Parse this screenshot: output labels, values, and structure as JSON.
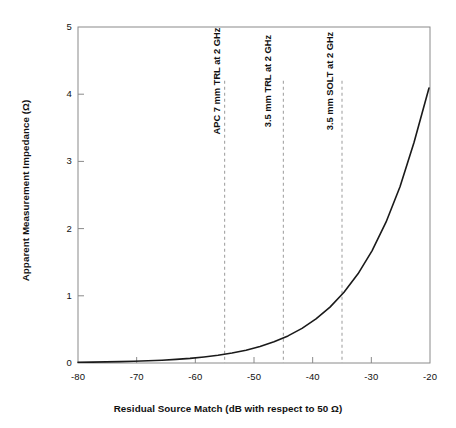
{
  "chart_data": {
    "type": "line",
    "title": "",
    "xlabel": "Residual Source Match (dB with respect to 50 Ω)",
    "ylabel": "Apparent Measurement Impedance (Ω)",
    "xlim": [
      -80,
      -20
    ],
    "ylim": [
      0,
      5
    ],
    "xticks": [
      -80,
      -70,
      -60,
      -50,
      -40,
      -30,
      -20
    ],
    "xtick_labels": [
      "-80",
      "-70",
      "-60",
      "-50",
      "-40",
      "-30",
      "-20"
    ],
    "yticks": [
      0,
      1,
      2,
      3,
      4,
      5
    ],
    "ytick_labels": [
      "0",
      "1",
      "2",
      "3",
      "4",
      "5"
    ],
    "grid": false,
    "legend": false,
    "series": [
      {
        "name": "Apparent Measurement Impedance",
        "color": "#1a1a1a",
        "x": [
          -80,
          -78,
          -76,
          -74,
          -72,
          -70,
          -68,
          -66,
          -64,
          -62,
          -60,
          -58,
          -56,
          -55,
          -54,
          -52,
          -50,
          -48,
          -46,
          -45,
          -44,
          -42,
          -40,
          -38,
          -36,
          -35,
          -34,
          -32,
          -30,
          -29,
          -28,
          -27,
          -26,
          -25,
          -24,
          -23,
          -22,
          -21,
          -20
        ],
        "y": [
          1.02,
          1.025,
          1.032,
          1.04,
          1.05,
          1.063,
          1.079,
          1.1,
          1.126,
          1.159,
          1.2,
          1.252,
          1.316,
          1.355,
          1.398,
          1.501,
          1.632,
          1.796,
          2.002,
          2.125,
          2.261,
          2.585,
          3.0,
          3.521,
          4.175,
          4.56,
          4.99,
          5.96,
          7.16,
          7.83,
          8.6,
          9.5,
          10.5,
          11.6,
          12.8,
          14.2,
          15.7,
          17.4,
          19.4
        ],
        "y_plot": [
          1.02,
          1.022,
          1.025,
          1.029,
          1.033,
          1.038,
          1.044,
          1.051,
          1.06,
          1.071,
          1.085,
          1.102,
          1.123,
          1.135,
          1.15,
          1.18,
          1.22,
          1.27,
          1.33,
          1.37,
          1.41,
          1.5,
          1.62,
          1.76,
          1.94,
          2.04,
          2.15,
          2.41,
          2.72,
          2.9,
          3.1,
          3.3,
          3.53,
          3.79,
          4.08,
          4.4,
          4.76,
          5.16,
          5.6
        ]
      }
    ],
    "annotations": [
      {
        "label": "APC 7 mm TRL at 2 GHz",
        "x": -55,
        "line_style": "dashed",
        "line_color": "#9a9a9a",
        "y_top": 4.2,
        "y_bottom": 0
      },
      {
        "label": "3.5 mm TRL at 2 GHz",
        "x": -45,
        "line_style": "dashed",
        "line_color": "#9a9a9a",
        "y_top": 4.2,
        "y_bottom": 0
      },
      {
        "label": "3.5 mm SOLT at 2 GHz",
        "x": -35,
        "line_style": "dashed",
        "line_color": "#9a9a9a",
        "y_top": 4.2,
        "y_bottom": 0
      }
    ],
    "curve_points_px": [
      [
        78,
        362.3
      ],
      [
        92,
        362.1
      ],
      [
        106,
        361.9
      ],
      [
        120,
        361.6
      ],
      [
        134,
        361.3
      ],
      [
        148,
        360.8
      ],
      [
        162,
        360.2
      ],
      [
        176,
        359.4
      ],
      [
        190,
        358.4
      ],
      [
        204,
        357.0
      ],
      [
        218,
        355.3
      ],
      [
        232,
        353.0
      ],
      [
        246,
        350.2
      ],
      [
        260,
        346.5
      ],
      [
        274,
        341.8
      ],
      [
        288,
        335.9
      ],
      [
        302,
        328.4
      ],
      [
        316,
        318.9
      ],
      [
        330,
        307.1
      ],
      [
        344,
        292.3
      ],
      [
        358,
        273.8
      ],
      [
        372,
        250.8
      ],
      [
        386,
        222.2
      ],
      [
        400,
        186.7
      ],
      [
        414,
        142.5
      ],
      [
        429,
        88.0
      ]
    ]
  },
  "axis_style": {
    "frame_color": "#8a8a8a",
    "curve_color": "#1a1a1a",
    "dash_color": "#9a9a9a",
    "background": "#ffffff"
  }
}
